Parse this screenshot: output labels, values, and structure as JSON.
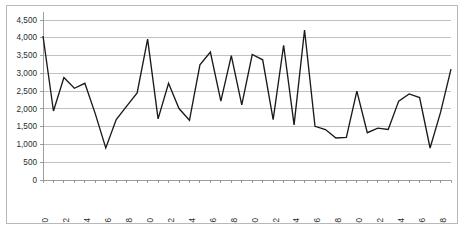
{
  "chart_data": {
    "type": "line",
    "title": "",
    "subtitle": "",
    "xlabel": "",
    "ylabel": "",
    "grid": "horizontal",
    "legend": "none",
    "ylim": [
      0,
      4500
    ],
    "ytick_labels": [
      "4,500",
      "4,000",
      "3,500",
      "3,000",
      "2,500",
      "2,000",
      "1,500",
      "1,000",
      "500",
      "0"
    ],
    "ytick_values": [
      4500,
      4000,
      3500,
      3000,
      2500,
      2000,
      1500,
      1000,
      500,
      0
    ],
    "xlim": [
      1970,
      2009
    ],
    "xtick_labels": [
      "1970",
      "1972",
      "1974",
      "1976",
      "1978",
      "1980",
      "1982",
      "1984",
      "1986",
      "1988",
      "1990",
      "1992",
      "1994",
      "1996",
      "1998",
      "2000",
      "2002",
      "2004",
      "2996",
      "2008"
    ],
    "xtick_values": [
      1970,
      1972,
      1974,
      1976,
      1978,
      1980,
      1982,
      1984,
      1986,
      1988,
      1990,
      1992,
      1994,
      1996,
      1998,
      2000,
      2002,
      2004,
      2006,
      2008
    ],
    "x": [
      1970,
      1971,
      1972,
      1973,
      1974,
      1975,
      1976,
      1977,
      1978,
      1979,
      1980,
      1981,
      1982,
      1983,
      1984,
      1985,
      1986,
      1987,
      1988,
      1989,
      1990,
      1991,
      1992,
      1993,
      1994,
      1995,
      1996,
      1997,
      1998,
      1999,
      2000,
      2001,
      2002,
      2003,
      2004,
      2005,
      2006,
      2007,
      2008,
      2009
    ],
    "values": [
      4050,
      1940,
      2880,
      2580,
      2720,
      1860,
      900,
      1700,
      2080,
      2450,
      3960,
      1720,
      2720,
      2010,
      1680,
      3240,
      3600,
      2220,
      3500,
      2110,
      3530,
      3380,
      1700,
      3790,
      1550,
      4220,
      1510,
      1420,
      1180,
      1200,
      2500,
      1330,
      1460,
      1420,
      2220,
      2420,
      2320,
      900,
      1900,
      3120
    ],
    "colors": {
      "line": "#1a1a1a",
      "grid": "#a6a6a6",
      "axis": "#868686",
      "text": "#2b2b2b",
      "border": "#b9b9b9",
      "background": "#ffffff"
    }
  }
}
